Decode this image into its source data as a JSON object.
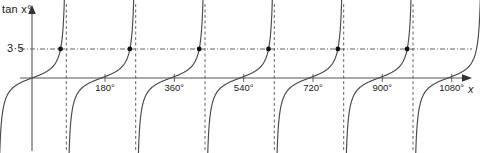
{
  "figure": {
    "width": 480,
    "height": 153,
    "background_color": "#ffffff"
  },
  "axes": {
    "y_axis_label": "tan x",
    "y_axis_label_degree": "°",
    "x_axis_label": "x",
    "threshold_label": "3·5",
    "axis_color": "#555555",
    "curve_color": "#4a4a4a",
    "asymptote_color": "#555555",
    "marker_color": "#111111"
  },
  "x_ticks": [
    {
      "label": "180°",
      "value": 180
    },
    {
      "label": "360°",
      "value": 360
    },
    {
      "label": "540°",
      "value": 540
    },
    {
      "label": "720°",
      "value": 720
    },
    {
      "label": "900°",
      "value": 900
    },
    {
      "label": "1080°",
      "value": 1080
    }
  ],
  "chart_data": {
    "type": "line",
    "title": "",
    "xlabel": "x",
    "ylabel": "tan x°",
    "function": "y = tan(x°)",
    "xlim": [
      0,
      1130
    ],
    "ylim": [
      -10,
      10
    ],
    "grid": false,
    "legend": null,
    "x_tick_labels": [
      "180°",
      "360°",
      "540°",
      "720°",
      "900°",
      "1080°"
    ],
    "x_tick_values": [
      180,
      360,
      540,
      720,
      900,
      1080
    ],
    "y_tick_labels": [
      "3·5"
    ],
    "y_tick_values": [
      3.5
    ],
    "reference_lines": [
      {
        "orientation": "horizontal",
        "value": 3.5,
        "style": "dash-dot",
        "label": "3·5"
      }
    ],
    "asymptotes": {
      "orientation": "vertical",
      "style": "dashed",
      "values": [
        90,
        270,
        450,
        630,
        810,
        990
      ]
    },
    "zero_crossings": [
      0,
      180,
      360,
      540,
      720,
      900,
      1080
    ],
    "markers": {
      "description": "intersections of y = tan x with y = 3.5",
      "style": "filled-circle",
      "x_values": [
        74,
        254,
        434,
        614,
        794,
        974
      ],
      "y_value": 3.5
    },
    "series": [
      {
        "name": "tan x°",
        "period": 180,
        "branches": 7
      }
    ]
  }
}
